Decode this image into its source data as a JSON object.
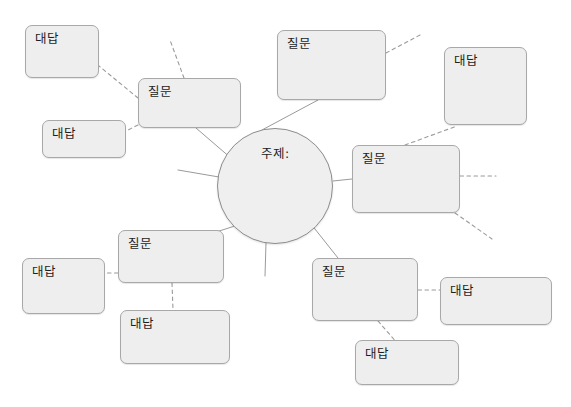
{
  "diagram": {
    "type": "mind-map",
    "title_text": "주제:",
    "question_label": "질문",
    "answer_label": "대답",
    "colors": {
      "node_fill": "#eeeeee",
      "node_border": "#a8a8a8",
      "center_fill": "#efefef",
      "center_border": "#8d8d8d",
      "solid_edge": "#9a9a9a",
      "dashed_edge": "#9a9a9a",
      "text": "#1d1d1d",
      "background": "#ffffff"
    },
    "center": {
      "label": "주제:",
      "cx": 275,
      "cy": 186,
      "r": 58
    },
    "nodes": [
      {
        "id": "q-topleft",
        "label": "질문",
        "x": 138,
        "y": 78,
        "w": 103,
        "h": 50
      },
      {
        "id": "a-topleft-1",
        "label": "대답",
        "x": 25,
        "y": 25,
        "w": 74,
        "h": 53
      },
      {
        "id": "a-topleft-2",
        "label": "대답",
        "x": 42,
        "y": 120,
        "w": 84,
        "h": 38
      },
      {
        "id": "q-top",
        "label": "질문",
        "x": 277,
        "y": 30,
        "w": 109,
        "h": 70
      },
      {
        "id": "a-top-right",
        "label": "대답",
        "x": 444,
        "y": 47,
        "w": 83,
        "h": 78
      },
      {
        "id": "q-right",
        "label": "질문",
        "x": 352,
        "y": 145,
        "w": 108,
        "h": 68
      },
      {
        "id": "q-bottomleft",
        "label": "질문",
        "x": 118,
        "y": 230,
        "w": 106,
        "h": 53
      },
      {
        "id": "a-bottomleft-1",
        "label": "대답",
        "x": 22,
        "y": 258,
        "w": 83,
        "h": 56
      },
      {
        "id": "a-bottomleft-2",
        "label": "대답",
        "x": 120,
        "y": 310,
        "w": 110,
        "h": 54
      },
      {
        "id": "q-bottomright",
        "label": "질문",
        "x": 312,
        "y": 258,
        "w": 106,
        "h": 63
      },
      {
        "id": "a-bottomright-1",
        "label": "대답",
        "x": 440,
        "y": 277,
        "w": 112,
        "h": 48
      },
      {
        "id": "a-bottomright-2",
        "label": "대답",
        "x": 355,
        "y": 340,
        "w": 104,
        "h": 45
      }
    ],
    "edges": [
      {
        "id": "e-center-qtopleft",
        "style": "solid",
        "x1": 232,
        "y1": 159,
        "x2": 196,
        "y2": 128
      },
      {
        "id": "e-center-qtop",
        "style": "solid",
        "x1": 262,
        "y1": 130,
        "x2": 318,
        "y2": 100
      },
      {
        "id": "e-center-qright",
        "style": "solid",
        "x1": 333,
        "y1": 181,
        "x2": 352,
        "y2": 179
      },
      {
        "id": "e-center-qbotleft",
        "style": "solid",
        "x1": 238,
        "y1": 225,
        "x2": 213,
        "y2": 233
      },
      {
        "id": "e-center-qbotright",
        "style": "solid",
        "x1": 311,
        "y1": 224,
        "x2": 338,
        "y2": 258
      },
      {
        "id": "e-center-stub-left",
        "style": "solid",
        "x1": 219,
        "y1": 177,
        "x2": 178,
        "y2": 170
      },
      {
        "id": "e-center-stub-down",
        "style": "solid",
        "x1": 266,
        "y1": 243,
        "x2": 265,
        "y2": 276
      },
      {
        "id": "e-qtopleft-atl1",
        "style": "dashed",
        "x1": 138,
        "y1": 98,
        "x2": 99,
        "y2": 66
      },
      {
        "id": "e-qtopleft-atl2",
        "style": "dashed",
        "x1": 138,
        "y1": 125,
        "x2": 126,
        "y2": 131
      },
      {
        "id": "e-qtopleft-stub",
        "style": "dashed",
        "x1": 184,
        "y1": 78,
        "x2": 170,
        "y2": 40
      },
      {
        "id": "e-qtop-stub",
        "style": "dashed",
        "x1": 386,
        "y1": 53,
        "x2": 420,
        "y2": 35
      },
      {
        "id": "e-qright-atopright",
        "style": "dashed",
        "x1": 405,
        "y1": 145,
        "x2": 457,
        "y2": 126
      },
      {
        "id": "e-qright-stub",
        "style": "dashed",
        "x1": 460,
        "y1": 176,
        "x2": 496,
        "y2": 176
      },
      {
        "id": "e-qright-stub2",
        "style": "dashed",
        "x1": 455,
        "y1": 213,
        "x2": 492,
        "y2": 239
      },
      {
        "id": "e-qbotleft-abl1",
        "style": "dashed",
        "x1": 118,
        "y1": 273,
        "x2": 105,
        "y2": 273
      },
      {
        "id": "e-qbotleft-abl2",
        "style": "dashed",
        "x1": 172,
        "y1": 283,
        "x2": 173,
        "y2": 310
      },
      {
        "id": "e-qbotright-abr1",
        "style": "dashed",
        "x1": 418,
        "y1": 290,
        "x2": 440,
        "y2": 290
      },
      {
        "id": "e-qbotright-abr2",
        "style": "dashed",
        "x1": 378,
        "y1": 321,
        "x2": 398,
        "y2": 344
      }
    ]
  }
}
